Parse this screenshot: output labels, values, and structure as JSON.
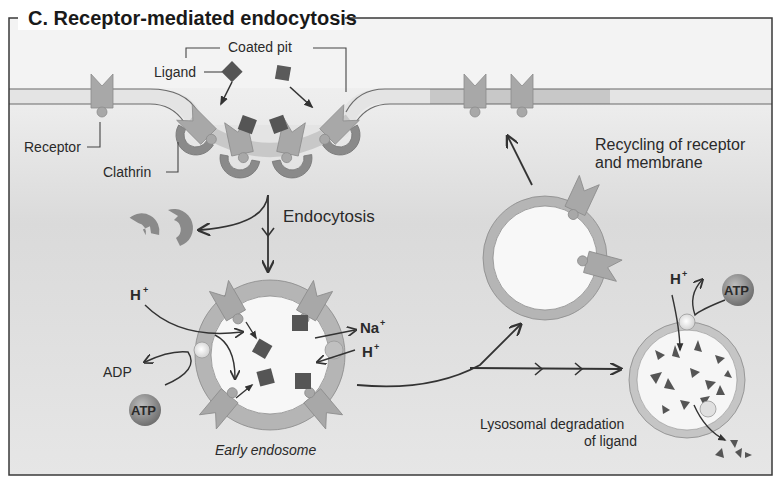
{
  "figure": {
    "title": "C. Receptor-mediated endocytosis",
    "colors": {
      "frame": "#3a3a3a",
      "extracellular": "#efefef",
      "cytoplasm": "#d9d9d9",
      "membrane": "#e6e6e6",
      "membrane_line": "#6a6a6a",
      "receptor": "#a8a8a8",
      "clathrin": "#8a8a8a",
      "ligand": "#555555",
      "vesicle_ring": "#b5b5b5",
      "vesicle_lumen": "#f7f7f7",
      "arrow": "#333333",
      "atp_ball": "#7a7a7a"
    }
  },
  "labels": {
    "coated_pit": "Coated pit",
    "ligand": "Ligand",
    "receptor": "Receptor",
    "clathrin": "Clathrin",
    "endocytosis": "Endocytosis",
    "recycling_line1": "Recycling of receptor",
    "recycling_line2": "and membrane",
    "early_endosome": "Early endosome",
    "lysosomal_line1": "Lysosomal degradation",
    "lysosomal_line2": "of ligand",
    "h_plus": "H",
    "plus": "+",
    "na": "Na",
    "adp": "ADP",
    "atp": "ATP"
  }
}
